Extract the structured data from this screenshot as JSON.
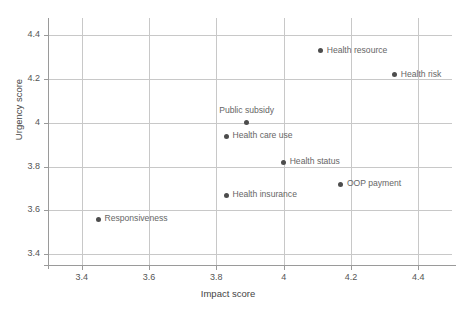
{
  "chart_data": {
    "type": "scatter",
    "title": "",
    "xlabel": "Impact score",
    "ylabel": "Urgency score",
    "xlim": [
      3.3,
      4.5
    ],
    "ylim": [
      3.35,
      4.48
    ],
    "xticks": [
      "3.4",
      "3.6",
      "3.8",
      "4",
      "4.2",
      "4.4"
    ],
    "xtick_values": [
      3.4,
      3.6,
      3.8,
      4.0,
      4.2,
      4.4
    ],
    "yticks": [
      "3.4",
      "3.6",
      "3.8",
      "4",
      "4.2",
      "4.4"
    ],
    "ytick_values": [
      3.4,
      3.6,
      3.8,
      4.0,
      4.2,
      4.4
    ],
    "grid": true,
    "legend": "none",
    "marker_color": "#4d4d4d",
    "label_color": "#666666",
    "grid_color": "#c8c8c8",
    "points": [
      {
        "label": "Health resource",
        "x": 4.11,
        "y": 4.33,
        "label_pos": "right"
      },
      {
        "label": "Health risk",
        "x": 4.33,
        "y": 4.22,
        "label_pos": "right"
      },
      {
        "label": "Public subsidy",
        "x": 3.89,
        "y": 4.0,
        "label_pos": "above"
      },
      {
        "label": "Health care use",
        "x": 3.83,
        "y": 3.94,
        "label_pos": "right"
      },
      {
        "label": "Health status",
        "x": 4.0,
        "y": 3.82,
        "label_pos": "right"
      },
      {
        "label": "OOP payment",
        "x": 4.17,
        "y": 3.72,
        "label_pos": "right"
      },
      {
        "label": "Health insurance",
        "x": 3.83,
        "y": 3.67,
        "label_pos": "right"
      },
      {
        "label": "Responsiveness",
        "x": 3.45,
        "y": 3.56,
        "label_pos": "right"
      }
    ]
  }
}
